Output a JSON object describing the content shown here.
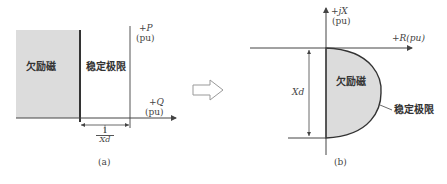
{
  "panel_a": {
    "region_underexcitation": "欠励磁",
    "region_stability_limit": "稳定极限",
    "axis_p_label": "+P",
    "axis_p_unit": "(pu)",
    "axis_q_label": "+Q",
    "axis_q_unit": "(pu)",
    "dim_numerator": "1",
    "dim_denominator": "Xd",
    "caption": "(a)"
  },
  "transform_arrow": "hollow-right-arrow",
  "panel_b": {
    "axis_x_label": "+jX",
    "axis_x_unit": "(pu)",
    "axis_r_label": "+R(pu)",
    "region_underexcitation": "欠励磁",
    "stability_limit_label": "稳定极限",
    "dim_label": "Xd",
    "caption": "(b)"
  },
  "colors": {
    "shade": "#dcdcdc",
    "line": "#444444"
  }
}
